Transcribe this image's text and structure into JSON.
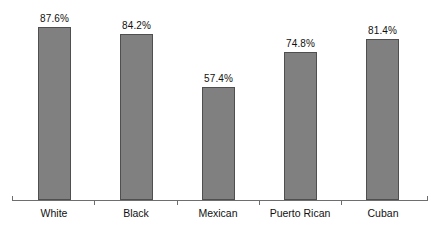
{
  "chart_data": {
    "type": "bar",
    "title": "",
    "subtitle": "",
    "xlabel": "",
    "ylabel": "",
    "ylim": [
      0,
      100
    ],
    "grid": false,
    "legend": "none",
    "categories": [
      "White",
      "Black",
      "Mexican",
      "Puerto Rican",
      "Cuban"
    ],
    "values": [
      87.6,
      84.2,
      57.4,
      74.8,
      81.4
    ],
    "value_labels": [
      "87.6%",
      "84.2%",
      "57.4%",
      "74.8%",
      "81.4%"
    ],
    "series": [
      {
        "name": "",
        "values": [
          87.6,
          84.2,
          57.4,
          74.8,
          81.4
        ]
      }
    ]
  },
  "style": {
    "bar_fill": "#808080",
    "bar_stroke": "#4f4f4f",
    "axis_color": "#6e6e6e",
    "text_color": "#111111",
    "background": "#ffffff"
  },
  "axis": {
    "baseline_name": "category-axis"
  }
}
